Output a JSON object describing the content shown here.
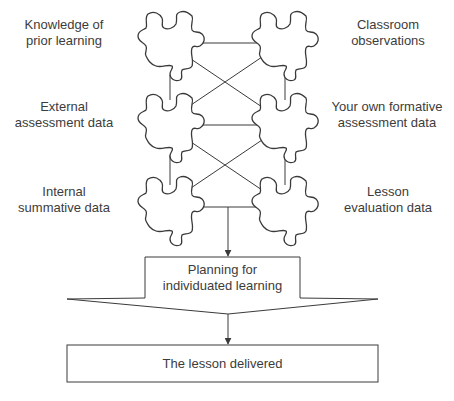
{
  "diagram": {
    "sources": {
      "left": [
        {
          "line1": "Knowledge of",
          "line2": "prior learning"
        },
        {
          "line1": "External",
          "line2": "assessment data"
        },
        {
          "line1": "Internal",
          "line2": "summative data"
        }
      ],
      "right": [
        {
          "line1": "Classroom",
          "line2": "observations"
        },
        {
          "line1": "Your own formative",
          "line2": "assessment data"
        },
        {
          "line1": "Lesson",
          "line2": "evaluation data"
        }
      ]
    },
    "planning": {
      "line1": "Planning for",
      "line2": "individuated learning"
    },
    "outcome": {
      "label": "The lesson delivered"
    },
    "colors": {
      "stroke": "#3a3a3a",
      "background": "#ffffff",
      "text": "#3c3c3c"
    }
  }
}
